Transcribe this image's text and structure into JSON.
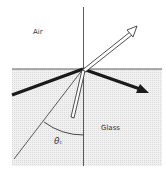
{
  "diagram": {
    "title": "",
    "labels": {
      "upper_medium": "Air",
      "lower_medium": "Glass",
      "angle_symbol": "θ",
      "angle_subscript": "c"
    },
    "colors": {
      "glass_fill": "#e6e6e6",
      "line": "#222222",
      "background": "#ffffff"
    }
  }
}
